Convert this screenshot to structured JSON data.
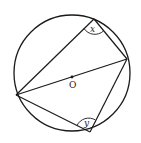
{
  "diagram": {
    "title": "",
    "circle": {
      "cx": 72,
      "cy": 73,
      "r": 58
    },
    "center_label": "O",
    "points": {
      "A": {
        "x": 16,
        "y": 95
      },
      "B": {
        "x": 94,
        "y": 19
      },
      "C": {
        "x": 127,
        "y": 59
      },
      "D": {
        "x": 90,
        "y": 132
      }
    },
    "segments": [
      [
        "A",
        "B"
      ],
      [
        "B",
        "C"
      ],
      [
        "A",
        "C"
      ],
      [
        "C",
        "D"
      ],
      [
        "A",
        "D"
      ]
    ],
    "angles": [
      {
        "label": "x",
        "vertex": "B"
      },
      {
        "label": "y",
        "vertex": "D"
      }
    ],
    "stroke_color": "#1a1a1a"
  }
}
